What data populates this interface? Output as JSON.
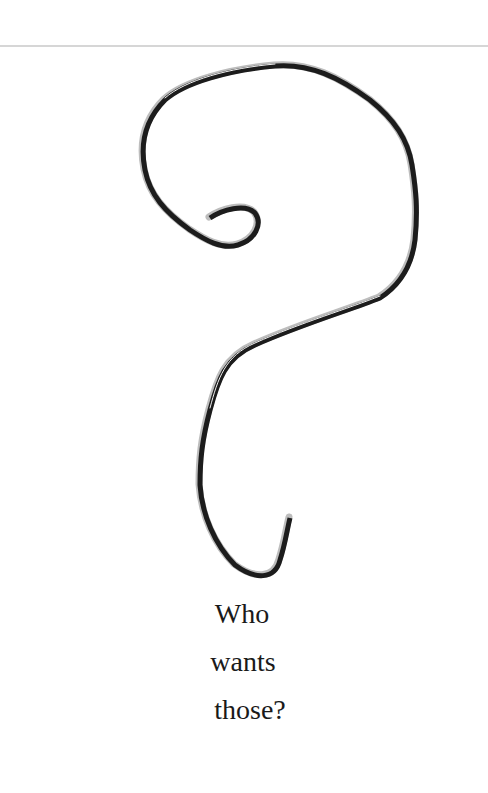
{
  "page": {
    "divider_color": "#d6d6d6",
    "background": "#ffffff"
  },
  "illustration": {
    "subject": "wire ornament hook bent into a question mark shape",
    "icon": "question-mark-hook-icon",
    "stroke_color": "#1c1c1c"
  },
  "caption": {
    "lines": [
      "Who",
      "wants",
      "those?"
    ]
  }
}
